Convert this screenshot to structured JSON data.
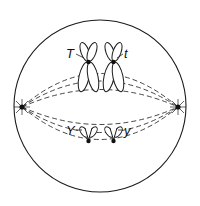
{
  "diagram": {
    "upper_pair": {
      "left_label": "T",
      "right_label": "t"
    },
    "lower_pair": {
      "left_label": "Y",
      "right_label": "y"
    }
  }
}
